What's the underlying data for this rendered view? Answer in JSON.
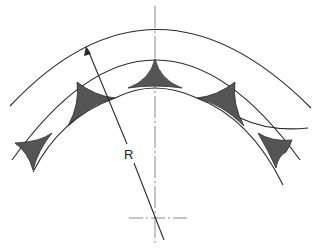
{
  "diagram": {
    "type": "engineering-cross-section",
    "labels": {
      "radius": "R"
    },
    "colors": {
      "line": "#2a2a2a",
      "fill": "#555555",
      "centerline": "#8a8a8a",
      "background": "#ffffff"
    },
    "elements": {
      "outer_arc": "outer circle arc",
      "middle_arc": "middle circle arc",
      "inner_profile": "scalloped inner profile",
      "shaded_cusps": 5,
      "center_mark": "crosshair at circle center",
      "radius_arrow": "arrow from center to outer arc labeled R"
    }
  }
}
